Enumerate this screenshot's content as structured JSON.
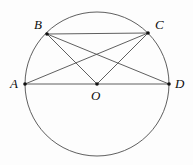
{
  "figure": {
    "background_color": "#fdfdfd",
    "stroke_color": "#4d4d4d",
    "point_color": "#111111",
    "label_color": "#0d0d0d"
  },
  "circle": {
    "name": "circumscribed-circle",
    "cx": 97,
    "cy": 84,
    "r": 72
  },
  "points": [
    {
      "id": "A",
      "label": "A",
      "x": 25,
      "y": 84,
      "label_x": 10,
      "label_y": 77
    },
    {
      "id": "B",
      "label": "B",
      "x": 47,
      "y": 34,
      "label_x": 34,
      "label_y": 18
    },
    {
      "id": "C",
      "label": "C",
      "x": 148,
      "y": 33,
      "label_x": 155,
      "label_y": 18
    },
    {
      "id": "D",
      "label": "D",
      "x": 169,
      "y": 84,
      "label_x": 175,
      "label_y": 77
    },
    {
      "id": "O",
      "label": "O",
      "x": 97,
      "y": 84,
      "label_x": 91,
      "label_y": 89
    }
  ],
  "segments": [
    {
      "id": "AD",
      "from": "A",
      "to": "D",
      "x1": 25,
      "y1": 84,
      "x2": 169,
      "y2": 84
    },
    {
      "id": "BC",
      "from": "B",
      "to": "C",
      "x1": 47,
      "y1": 34,
      "x2": 148,
      "y2": 33
    },
    {
      "id": "BD",
      "from": "B",
      "to": "D",
      "x1": 47,
      "y1": 34,
      "x2": 169,
      "y2": 84
    },
    {
      "id": "AC",
      "from": "A",
      "to": "C",
      "x1": 25,
      "y1": 84,
      "x2": 148,
      "y2": 33
    },
    {
      "id": "OB",
      "from": "O",
      "to": "B",
      "x1": 97,
      "y1": 84,
      "x2": 47,
      "y2": 34
    },
    {
      "id": "OC",
      "from": "O",
      "to": "C",
      "x1": 97,
      "y1": 84,
      "x2": 148,
      "y2": 33
    }
  ]
}
